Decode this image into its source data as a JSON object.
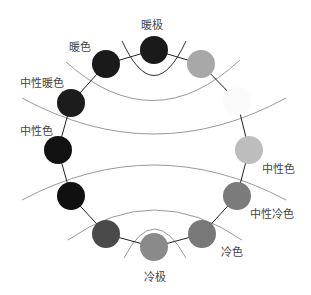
{
  "labels": {
    "warm_pole": "暖极",
    "warm": "暖色",
    "neutral_warm": "中性暖色",
    "neutral_left": "中性色",
    "neutral_right": "中性色",
    "neutral_cool": "中性冷色",
    "cool": "冷色",
    "cool_pole": "冷极"
  },
  "circles": [
    {
      "cx": 106,
      "cy": 64,
      "fill": "#1a1a1a"
    },
    {
      "cx": 154,
      "cy": 50,
      "fill": "#1a1a1a"
    },
    {
      "cx": 201,
      "cy": 64,
      "fill": "#a8a8a8"
    },
    {
      "cx": 237,
      "cy": 101,
      "fill": "#fbfbfb"
    },
    {
      "cx": 249,
      "cy": 150,
      "fill": "#bdbdbd"
    },
    {
      "cx": 237,
      "cy": 196,
      "fill": "#7b7b7b"
    },
    {
      "cx": 202,
      "cy": 234,
      "fill": "#787878"
    },
    {
      "cx": 154,
      "cy": 247,
      "fill": "#8a8a8a"
    },
    {
      "cx": 106,
      "cy": 234,
      "fill": "#4a4a4a"
    },
    {
      "cx": 71,
      "cy": 196,
      "fill": "#101010"
    },
    {
      "cx": 58,
      "cy": 150,
      "fill": "#121212"
    },
    {
      "cx": 71,
      "cy": 103,
      "fill": "#1c1c1c"
    }
  ]
}
